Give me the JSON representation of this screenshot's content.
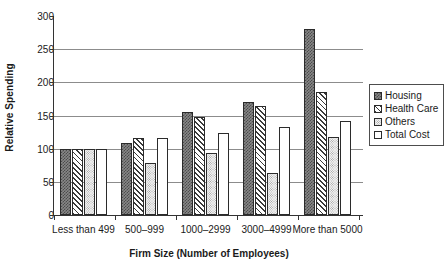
{
  "chart_data": {
    "type": "bar",
    "title": "",
    "xlabel": "Firm Size (Number of Employees)",
    "ylabel": "Relative Spending",
    "ylim": [
      0,
      300
    ],
    "yticks": [
      0,
      50,
      100,
      150,
      200,
      250,
      300
    ],
    "grid": true,
    "legend_position": "right",
    "categories": [
      "Less than 499",
      "500–999",
      "1000–2999",
      "3000–4999",
      "More than 5000"
    ],
    "series": [
      {
        "name": "Housing",
        "color": "#878787",
        "pattern": "checker",
        "values": [
          100,
          109,
          156,
          170,
          281
        ]
      },
      {
        "name": "Health Care",
        "color": "#ffffff",
        "pattern": "diagonal",
        "values": [
          100,
          116,
          148,
          165,
          186
        ]
      },
      {
        "name": "Others",
        "color": "#f2f2f2",
        "pattern": "dots",
        "values": [
          100,
          79,
          94,
          64,
          118
        ]
      },
      {
        "name": "Total Cost",
        "color": "#ffffff",
        "pattern": "solid",
        "values": [
          100,
          116,
          124,
          132,
          141
        ]
      }
    ]
  }
}
